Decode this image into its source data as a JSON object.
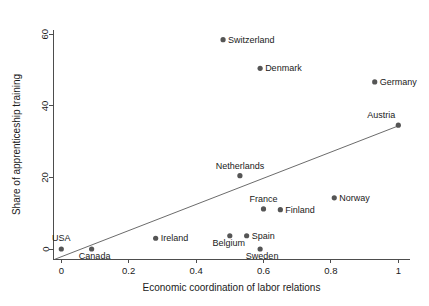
{
  "chart_data": {
    "type": "scatter",
    "title": "",
    "xlabel": "Economic coordination of labor relations",
    "ylabel": "Share of apprenticeship training",
    "xlim": [
      -0.02,
      1.04
    ],
    "ylim": [
      -3.5,
      62
    ],
    "grid": false,
    "legend": "none",
    "xticks": [
      "0",
      "0.2",
      "0.4",
      "0.6",
      "0.8",
      "1"
    ],
    "xtick_values": [
      0,
      0.2,
      0.4,
      0.6,
      0.8,
      1
    ],
    "yticks": [
      "0",
      "20",
      "40",
      "60"
    ],
    "ytick_values": [
      0,
      20,
      40,
      60
    ],
    "points": [
      {
        "label": "USA",
        "x": 0.0,
        "y": 0.0,
        "label_dx": 0,
        "label_dy": -8,
        "label_anchor": "middle"
      },
      {
        "label": "Canada",
        "x": 0.09,
        "y": 0.0,
        "label_dx": 3,
        "label_dy": 10,
        "label_anchor": "middle"
      },
      {
        "label": "Ireland",
        "x": 0.28,
        "y": 3.0,
        "label_dx": 5,
        "label_dy": 3,
        "label_anchor": "start"
      },
      {
        "label": "Belgium",
        "x": 0.5,
        "y": 3.7,
        "label_dx": -1,
        "label_dy": 10,
        "label_anchor": "middle"
      },
      {
        "label": "Spain",
        "x": 0.55,
        "y": 3.7,
        "label_dx": 5,
        "label_dy": 3,
        "label_anchor": "start"
      },
      {
        "label": "Sweden",
        "x": 0.59,
        "y": 0.0,
        "label_dx": 2,
        "label_dy": 10,
        "label_anchor": "middle"
      },
      {
        "label": "Netherlands",
        "x": 0.53,
        "y": 20.5,
        "label_dx": 0,
        "label_dy": -7,
        "label_anchor": "middle"
      },
      {
        "label": "France",
        "x": 0.6,
        "y": 11.2,
        "label_dx": 0,
        "label_dy": -7,
        "label_anchor": "middle"
      },
      {
        "label": "Finland",
        "x": 0.65,
        "y": 11.0,
        "label_dx": 5,
        "label_dy": 3,
        "label_anchor": "start"
      },
      {
        "label": "Norway",
        "x": 0.81,
        "y": 14.3,
        "label_dx": 5,
        "label_dy": 3,
        "label_anchor": "start"
      },
      {
        "label": "Switzerland",
        "x": 0.48,
        "y": 58.5,
        "label_dx": 5,
        "label_dy": 3,
        "label_anchor": "start"
      },
      {
        "label": "Denmark",
        "x": 0.59,
        "y": 50.5,
        "label_dx": 5,
        "label_dy": 3,
        "label_anchor": "start"
      },
      {
        "label": "Germany",
        "x": 0.93,
        "y": 46.7,
        "label_dx": 5,
        "label_dy": 3,
        "label_anchor": "start"
      },
      {
        "label": "Austria",
        "x": 1.0,
        "y": 34.6,
        "label_dx": -3,
        "label_dy": -7,
        "label_anchor": "end"
      }
    ],
    "fit_line": {
      "name": "linear fit",
      "x_start": -0.02,
      "y_start": -2.9,
      "x_end": 1.0,
      "y_end": 34.4
    },
    "colors": {
      "marker": "#555555",
      "fit_line": "#5a5a5a",
      "axis": "#4d4d4d",
      "text": "#1a1a1a",
      "background": "#ffffff"
    }
  }
}
